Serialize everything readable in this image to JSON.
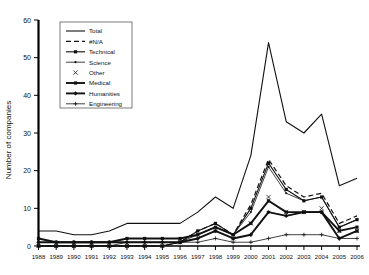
{
  "chart_data": {
    "type": "line",
    "title": "",
    "xlabel": "",
    "ylabel": "Number of companies",
    "ylim": [
      0,
      60
    ],
    "yticks": [
      0,
      10,
      20,
      30,
      40,
      50,
      60
    ],
    "grid": false,
    "legend_position": "top-left",
    "categories": [
      "1988",
      "1989",
      "1990",
      "1991",
      "1992",
      "1993",
      "1994",
      "1995",
      "1996",
      "1997",
      "1998",
      "1999",
      "2000",
      "2001",
      "2002",
      "2003",
      "2004",
      "2005",
      "2006"
    ],
    "series": [
      {
        "name": "Total",
        "style": "solid",
        "marker": "none",
        "values": [
          4,
          4,
          3,
          3,
          4,
          6,
          6,
          6,
          6,
          9,
          13,
          10,
          24,
          54,
          33,
          30,
          35,
          16,
          18
        ]
      },
      {
        "name": "#N/A",
        "style": "dashed",
        "marker": "none",
        "values": [
          0,
          0,
          0,
          0,
          0,
          0,
          0,
          0,
          1,
          4,
          6,
          3,
          11,
          23,
          16,
          13,
          14,
          6,
          8
        ]
      },
      {
        "name": "Technical",
        "style": "solid",
        "marker": "square",
        "values": [
          0,
          0,
          0,
          0,
          0,
          0,
          0,
          0,
          1,
          4,
          6,
          3,
          10,
          22,
          15,
          12,
          13,
          5,
          7
        ]
      },
      {
        "name": "Science",
        "style": "thin",
        "marker": "dot",
        "values": [
          0,
          0,
          0,
          0,
          0,
          0,
          0,
          0,
          1,
          3,
          5,
          3,
          9,
          21,
          14,
          12,
          13,
          5,
          7
        ]
      },
      {
        "name": "Other",
        "style": "none",
        "marker": "x",
        "values": [
          0,
          0,
          0,
          0,
          0,
          0,
          0,
          0,
          1,
          3,
          4,
          2,
          6,
          13,
          9,
          9,
          10,
          4,
          4
        ]
      },
      {
        "name": "Medical",
        "style": "bold",
        "marker": "square",
        "values": [
          2,
          1,
          1,
          1,
          1,
          2,
          2,
          2,
          2,
          3,
          5,
          3,
          6,
          12,
          9,
          9,
          9,
          4,
          5
        ]
      },
      {
        "name": "Humanities",
        "style": "bold",
        "marker": "diamond",
        "values": [
          1,
          1,
          1,
          1,
          1,
          1,
          1,
          1,
          1,
          2,
          4,
          2,
          3,
          9,
          8,
          9,
          9,
          2,
          4
        ]
      },
      {
        "name": "Engineering",
        "style": "thin",
        "marker": "plus",
        "values": [
          0,
          0,
          0,
          0,
          0,
          1,
          1,
          1,
          1,
          1,
          2,
          1,
          1,
          2,
          3,
          3,
          3,
          2,
          2
        ]
      }
    ]
  },
  "axes": {
    "ylabel": "Number of companies",
    "ytick_labels": [
      "0",
      "10",
      "20",
      "30",
      "40",
      "50",
      "60"
    ],
    "xtick_labels": [
      "1988",
      "1989",
      "1990",
      "1991",
      "1992",
      "1993",
      "1994",
      "1995",
      "1996",
      "1997",
      "1998",
      "1999",
      "2000",
      "2001",
      "2002",
      "2003",
      "2004",
      "2005",
      "2006"
    ]
  },
  "legend": {
    "items": [
      {
        "label": "Total"
      },
      {
        "label": "#N/A"
      },
      {
        "label": "Technical"
      },
      {
        "label": "Science"
      },
      {
        "label": "Other"
      },
      {
        "label": "Medical"
      },
      {
        "label": "Humanities"
      },
      {
        "label": "Engineering"
      }
    ]
  },
  "colors": {
    "line": "#111111",
    "background": "#ffffff",
    "axis": "#000000"
  }
}
